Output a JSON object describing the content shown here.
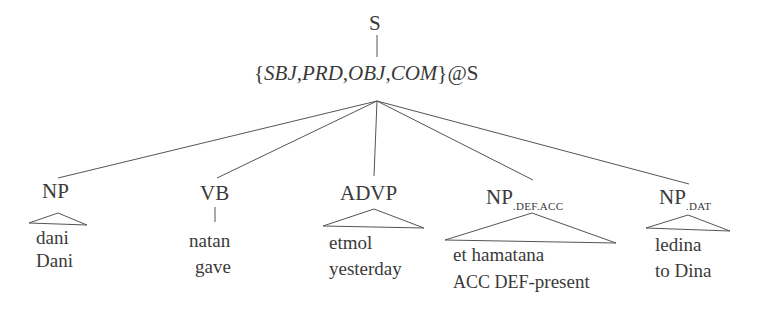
{
  "diagram": {
    "type": "syntax-tree",
    "root": {
      "label": "S"
    },
    "intermediate": {
      "set_open": "{",
      "features": "SBJ,PRD,OBJ,COM",
      "set_close": "}",
      "suffix": "@S"
    },
    "children": [
      {
        "label": "NP",
        "subscript": "",
        "attachment": "triangle",
        "words": [
          "dani",
          "Dani"
        ]
      },
      {
        "label": "VB",
        "subscript": "",
        "attachment": "line",
        "words": [
          "natan",
          "gave"
        ]
      },
      {
        "label": "ADVP",
        "subscript": "",
        "attachment": "triangle",
        "words": [
          "etmol",
          "yesterday"
        ]
      },
      {
        "label": "NP",
        "subscript": ".DEF.ACC",
        "attachment": "triangle",
        "words": [
          "et hamatana"
        ],
        "gloss": {
          "smallcaps": "ACC DEF",
          "rest": "-present"
        }
      },
      {
        "label": "NP",
        "subscript": ".DAT",
        "attachment": "triangle",
        "words": [
          "ledina",
          "to Dina"
        ]
      }
    ],
    "line_color": "#555555",
    "text_color": "#3a3a3a"
  }
}
